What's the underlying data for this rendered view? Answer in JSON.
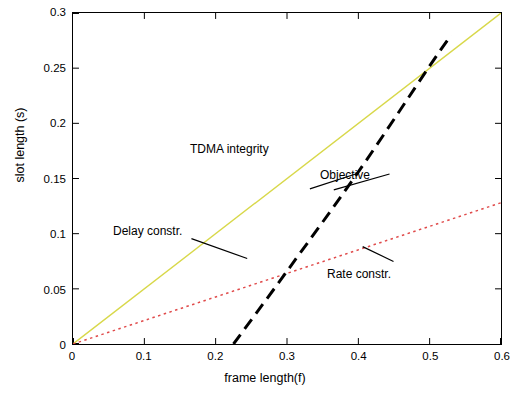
{
  "chart_data": {
    "type": "line",
    "title": "",
    "xlabel": "frame length(f)",
    "ylabel": "slot length (s)",
    "xlim": [
      0,
      0.6
    ],
    "ylim": [
      0,
      0.3
    ],
    "xticks": [
      "0",
      "0.1",
      "0.2",
      "0.3",
      "0.4",
      "0.5",
      "0.6"
    ],
    "yticks": [
      "0",
      "0.05",
      "0.1",
      "0.15",
      "0.2",
      "0.25",
      "0.3"
    ],
    "grid": false,
    "legend": "none (inline annotations)",
    "series": [
      {
        "name": "TDMA integrity",
        "style": "solid",
        "color": "#d8d84a",
        "x": [
          0,
          0.6
        ],
        "y": [
          0,
          0.3
        ]
      },
      {
        "name": "Delay constr.",
        "style": "dotted",
        "color": "#3a3ad0",
        "x": [
          0,
          0.05,
          0.1,
          0.15,
          0.2,
          0.25,
          0.3,
          0.35,
          0.4,
          0.45,
          0.5,
          0.55,
          0.6
        ],
        "y": [
          0,
          0.018,
          0.037,
          0.057,
          0.079,
          0.102,
          0.127,
          0.154,
          0.183,
          0.214,
          0.247,
          0.282,
          0.32
        ]
      },
      {
        "name": "Objective",
        "style": "dashed",
        "color": "#000000",
        "x": [
          0.225,
          0.3,
          0.4,
          0.5,
          0.53
        ],
        "y": [
          0,
          0.066,
          0.156,
          0.252,
          0.28
        ]
      },
      {
        "name": "Rate constr.",
        "style": "dotted",
        "color": "#e04a4a",
        "x": [
          0,
          0.6
        ],
        "y": [
          0,
          0.128
        ]
      }
    ],
    "annotations": [
      {
        "label": "TDMA integrity",
        "text_x": 0.262,
        "text_y": 0.196,
        "point_x": 0.4,
        "point_y": 0.2
      },
      {
        "label": "Objective",
        "text_x": 0.455,
        "text_y": 0.152,
        "point_x": 0.355,
        "point_y": 0.166
      },
      {
        "label": "Delay constr.",
        "text_x": 0.072,
        "text_y": 0.122,
        "point_x": 0.245,
        "point_y": 0.099
      },
      {
        "label": "Rate constr.",
        "text_x": 0.458,
        "text_y": 0.062,
        "point_x": 0.405,
        "point_y": 0.088
      }
    ]
  }
}
